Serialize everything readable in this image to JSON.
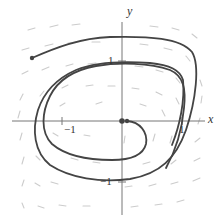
{
  "figure": {
    "type": "phase-portrait",
    "axes": {
      "x_label": "x",
      "y_label": "y",
      "ticks": {
        "x_pos": "1",
        "x_neg": "−1",
        "y_pos": "1",
        "y_neg": "−1"
      }
    },
    "colors": {
      "trajectory": "#444444",
      "axis": "#777777",
      "field_arrow": "#c8c8c8"
    },
    "trajectories": [
      {
        "name": "outer",
        "start_point": "upper-left",
        "direction": "spiral-inward clockwise"
      },
      {
        "name": "inner",
        "start_point": "near origin",
        "direction": "spiral-outward clockwise"
      }
    ],
    "equilibrium": "origin"
  }
}
